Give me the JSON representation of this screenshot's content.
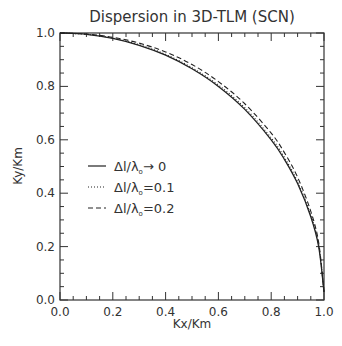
{
  "chart_data": {
    "type": "line",
    "title": "Dispersion in 3D-TLM (SCN)",
    "xlabel": "Kx/Km",
    "ylabel": "Ky/Km",
    "xlim": [
      0.0,
      1.0
    ],
    "ylim": [
      0.0,
      1.0
    ],
    "x_ticks": [
      "0.0",
      "0.2",
      "0.4",
      "0.6",
      "0.8",
      "1.0"
    ],
    "y_ticks": [
      "0.0",
      "0.2",
      "0.4",
      "0.6",
      "0.8",
      "1.0"
    ],
    "minor_tick_step": 0.05,
    "grid": false,
    "legend_position": "center-left inside plot",
    "x": [
      0.0,
      0.1,
      0.2,
      0.3,
      0.4,
      0.5,
      0.6,
      0.7,
      0.8,
      0.85,
      0.9,
      0.95,
      0.98,
      1.0
    ],
    "series": [
      {
        "name": "Δl/λ₀→ 0",
        "style": "solid",
        "values": [
          1.0,
          0.995,
          0.98,
          0.954,
          0.917,
          0.866,
          0.8,
          0.714,
          0.6,
          0.527,
          0.436,
          0.312,
          0.199,
          0.03
        ]
      },
      {
        "name": "Δl/λ₀=0.1",
        "style": "dotted",
        "values": [
          1.0,
          0.995,
          0.981,
          0.956,
          0.92,
          0.87,
          0.805,
          0.72,
          0.607,
          0.534,
          0.443,
          0.318,
          0.204,
          0.03
        ]
      },
      {
        "name": "Δl/λ₀=0.2",
        "style": "dashed",
        "values": [
          1.0,
          0.996,
          0.984,
          0.962,
          0.929,
          0.882,
          0.818,
          0.735,
          0.625,
          0.552,
          0.46,
          0.332,
          0.214,
          0.03
        ]
      }
    ]
  },
  "legend": {
    "items": [
      {
        "prefix": "Δl/λ",
        "sub": "o",
        "suffix": "→ 0"
      },
      {
        "prefix": "Δl/λ",
        "sub": "o",
        "suffix": "=0.1"
      },
      {
        "prefix": "Δl/λ",
        "sub": "o",
        "suffix": "=0.2"
      }
    ]
  },
  "colors": {
    "line": "#222222",
    "axis": "#333333",
    "background": "#ffffff"
  }
}
